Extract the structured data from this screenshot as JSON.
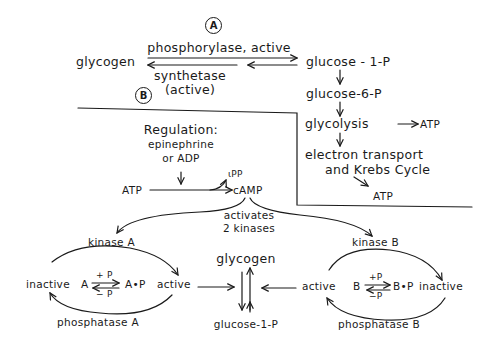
{
  "panel_a": {
    "marker": "A",
    "glycogen": "glycogen",
    "forward_enzyme": "phosphorylase, active",
    "reverse_enzyme_line1": "synthetase",
    "reverse_enzyme_line2": "(active)",
    "glucose_1p": "glucose - 1-P",
    "glucose_6p": "glucose-6-P",
    "glycolysis": "glycolysis",
    "glycolysis_product": "ATP",
    "electron_line1": "electron transport",
    "electron_line2": "and Krebs Cycle",
    "final_product": "ATP"
  },
  "panel_b": {
    "marker": "B",
    "regulation_title": "Regulation:",
    "regulation_line2": "epinephrine",
    "regulation_line3": "or ADP",
    "atp": "ATP",
    "ppi": "ιPP",
    "camp": "cAMP",
    "activates_line1": "activates",
    "activates_line2": "2 kinases",
    "kinase_a": "kinase A",
    "phosphatase_a": "phosphatase A",
    "inactive_a": "inactive",
    "a": "A",
    "plus_p_a": "+ P",
    "minus_p_a": "− P",
    "ap": "A•P",
    "active_a": "active",
    "glycogen": "glycogen",
    "glucose_1p": "glucose-1-P",
    "kinase_b": "kinase B",
    "phosphatase_b": "phosphatase B",
    "active_b": "active",
    "b": "B",
    "plus_p_b": "+P",
    "minus_p_b": "−P",
    "bp": "B•P",
    "inactive_b": "inactive"
  },
  "colors": {
    "ink": "#1a1a1a",
    "background": "#ffffff"
  }
}
